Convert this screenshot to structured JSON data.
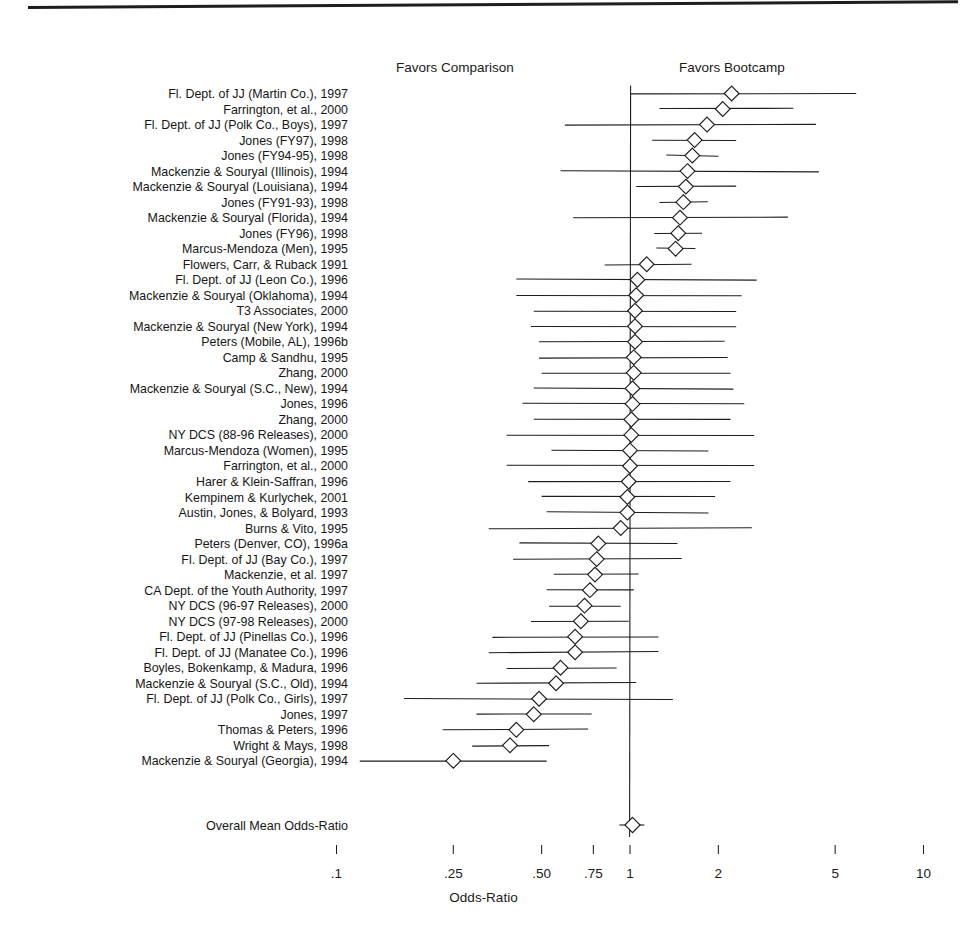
{
  "figure": {
    "top_rule": true,
    "header_left": "Favors Comparison",
    "header_right": "Favors Bootcamp",
    "xaxis_title": "Odds-Ratio",
    "overall_label": "Overall Mean Odds-Ratio"
  },
  "chart_data": {
    "type": "forest",
    "title": "",
    "xlabel": "Odds-Ratio",
    "ylabel": "",
    "xscale": "log",
    "xlim": [
      0.09,
      11.0
    ],
    "xticks": [
      0.1,
      0.25,
      0.5,
      0.75,
      1,
      2,
      5,
      10
    ],
    "xticklabels": [
      ".1",
      ".25",
      ".50",
      ".75",
      "1",
      "2",
      "5",
      "10"
    ],
    "grid": false,
    "reference_line": 1.0,
    "legend": [],
    "annotations": [
      "Favors Comparison",
      "Favors Bootcamp"
    ],
    "marker": "open-diamond",
    "categories": [
      "Fl. Dept. of JJ (Martin Co.), 1997",
      "Farrington, et al., 2000",
      "Fl. Dept. of JJ (Polk Co., Boys), 1997",
      "Jones (FY97), 1998",
      "Jones (FY94-95), 1998",
      "Mackenzie & Souryal (Illinois), 1994",
      "Mackenzie & Souryal (Louisiana), 1994",
      "Jones (FY91-93), 1998",
      "Mackenzie & Souryal (Florida), 1994",
      "Jones (FY96), 1998",
      "Marcus-Mendoza (Men), 1995",
      "Flowers, Carr, & Ruback 1991",
      "Fl. Dept. of JJ (Leon Co.), 1996",
      "Mackenzie & Souryal (Oklahoma), 1994",
      "T3 Associates, 2000",
      "Mackenzie & Souryal (New York), 1994",
      "Peters (Mobile, AL), 1996b",
      "Camp & Sandhu, 1995",
      "Zhang, 2000",
      "Mackenzie & Souryal (S.C., New), 1994",
      "Jones, 1996",
      "Zhang, 2000",
      "NY DCS (88-96 Releases), 2000",
      "Marcus-Mendoza (Women), 1995",
      "Farrington, et al., 2000",
      "Harer & Klein-Saffran, 1996",
      "Kempinem & Kurlychek, 2001",
      "Austin, Jones, & Bolyard, 1993",
      "Burns & Vito, 1995",
      "Peters (Denver, CO), 1996a",
      "Fl. Dept. of JJ (Bay Co.), 1997",
      "Mackenzie, et al. 1997",
      "CA Dept. of the Youth Authority, 1997",
      "NY DCS (96-97 Releases), 2000",
      "NY DCS (97-98 Releases), 2000",
      "Fl. Dept. of JJ (Pinellas Co.), 1996",
      "Fl. Dept. of JJ (Manatee Co.), 1996",
      "Boyles, Bokenkamp, & Madura, 1996",
      "Mackenzie & Souryal (S.C., Old), 1994",
      "Fl. Dept. of JJ (Polk Co., Girls), 1997",
      "Jones, 1997",
      "Thomas & Peters, 1996",
      "Wright & Mays, 1998",
      "Mackenzie & Souryal (Georgia), 1994"
    ],
    "estimates": [
      2.22,
      2.07,
      1.83,
      1.66,
      1.63,
      1.57,
      1.55,
      1.52,
      1.48,
      1.46,
      1.43,
      1.14,
      1.06,
      1.05,
      1.04,
      1.04,
      1.04,
      1.03,
      1.03,
      1.02,
      1.02,
      1.01,
      1.01,
      1.0,
      1.0,
      0.99,
      0.98,
      0.98,
      0.93,
      0.78,
      0.77,
      0.76,
      0.73,
      0.7,
      0.68,
      0.65,
      0.65,
      0.58,
      0.56,
      0.49,
      0.47,
      0.41,
      0.39,
      0.25
    ],
    "ci_low": [
      1.0,
      1.26,
      0.6,
      1.19,
      1.33,
      0.58,
      1.05,
      1.26,
      0.64,
      1.21,
      1.23,
      0.82,
      0.41,
      0.41,
      0.47,
      0.46,
      0.49,
      0.49,
      0.5,
      0.47,
      0.43,
      0.47,
      0.38,
      0.54,
      0.38,
      0.45,
      0.5,
      0.52,
      0.33,
      0.42,
      0.4,
      0.55,
      0.52,
      0.53,
      0.46,
      0.34,
      0.33,
      0.38,
      0.3,
      0.17,
      0.3,
      0.23,
      0.29,
      0.12
    ],
    "ci_high": [
      5.9,
      3.6,
      4.3,
      2.3,
      2.0,
      4.4,
      2.3,
      1.84,
      3.45,
      1.76,
      1.67,
      1.62,
      2.7,
      2.4,
      2.3,
      2.3,
      2.1,
      2.15,
      2.2,
      2.25,
      2.45,
      2.2,
      2.65,
      1.85,
      2.65,
      2.2,
      1.95,
      1.85,
      2.6,
      1.45,
      1.5,
      1.07,
      1.03,
      0.93,
      0.99,
      1.25,
      1.25,
      0.9,
      1.05,
      1.4,
      0.74,
      0.72,
      0.53,
      0.52
    ],
    "overall": {
      "label": "Overall Mean Odds-Ratio",
      "estimate": 1.02,
      "ci_low": 0.92,
      "ci_high": 1.12
    }
  },
  "style": {
    "line_color": "#1d1d1d",
    "marker_fill": "#ffffff",
    "text_color": "#161616",
    "background": "#ffffff"
  }
}
